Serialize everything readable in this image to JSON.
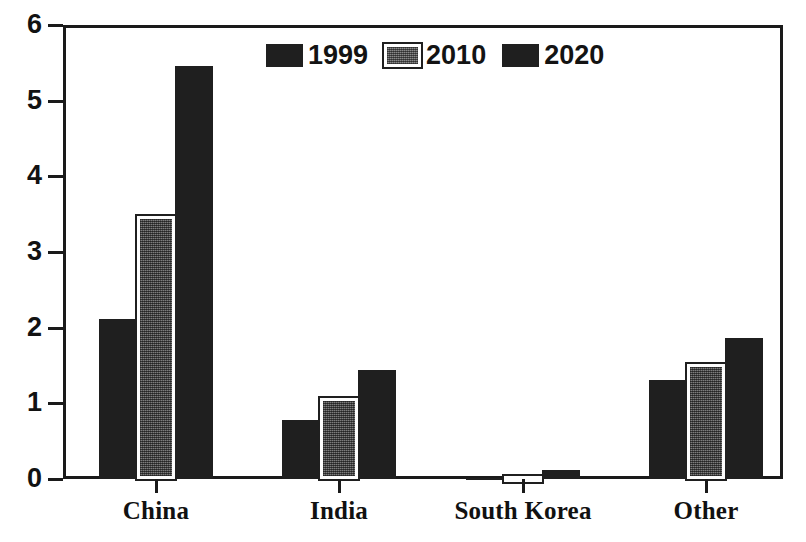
{
  "chart_data": {
    "type": "bar",
    "title": "",
    "subtitle": "",
    "xlabel": "",
    "ylabel": "",
    "categories": [
      "China",
      "India",
      "South Korea",
      "Other"
    ],
    "series": [
      {
        "name": "1999",
        "values": [
          2.11,
          0.78,
          0.01,
          1.31
        ],
        "color": "#1f1f1f"
      },
      {
        "name": "2010",
        "values": [
          3.47,
          1.07,
          0.04,
          1.52
        ],
        "color": "#7d7d7d"
      },
      {
        "name": "2020",
        "values": [
          5.46,
          1.44,
          0.12,
          1.86
        ],
        "color": "#1f1f1f"
      }
    ],
    "ylim": [
      0,
      6
    ],
    "y_ticks": [
      "0",
      "1",
      "2",
      "3",
      "4",
      "5",
      "6"
    ],
    "grid": false,
    "legend_position": "top-center",
    "legend_entries": [
      "1999",
      "2010",
      "2020"
    ]
  },
  "axis": {
    "y_labels": [
      "6",
      "5",
      "4",
      "3",
      "2",
      "1",
      "0"
    ],
    "x_labels": [
      "China",
      "India",
      "South Korea",
      "Other"
    ]
  },
  "legend": {
    "items": [
      {
        "label": "1999",
        "swatch": "legend-swatch-1999"
      },
      {
        "label": "2010",
        "swatch": "legend-swatch-2010"
      },
      {
        "label": "2020",
        "swatch": "legend-swatch-2020"
      }
    ]
  }
}
